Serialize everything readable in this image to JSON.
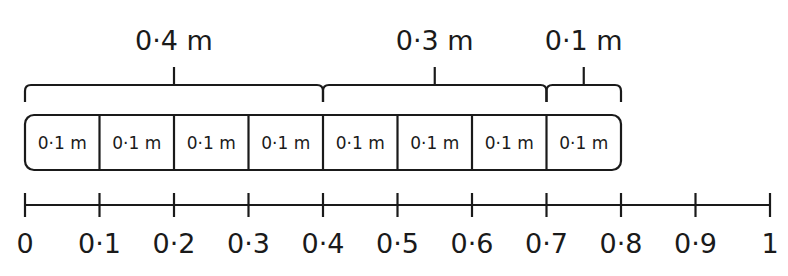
{
  "diagram": {
    "type": "bar-model-number-line",
    "groups": [
      {
        "label": "0·4 m",
        "start": 0,
        "end": 0.4
      },
      {
        "label": "0·3 m",
        "start": 0.4,
        "end": 0.7
      },
      {
        "label": "0·1 m",
        "start": 0.7,
        "end": 0.8
      }
    ],
    "cells": [
      "0·1 m",
      "0·1 m",
      "0·1 m",
      "0·1 m",
      "0·1 m",
      "0·1 m",
      "0·1 m",
      "0·1 m"
    ],
    "number_line": {
      "min": 0,
      "max": 1,
      "ticks": [
        0,
        0.1,
        0.2,
        0.3,
        0.4,
        0.5,
        0.6,
        0.7,
        0.8,
        0.9,
        1
      ],
      "tick_labels": [
        "0",
        "0·1",
        "0·2",
        "0·3",
        "0·4",
        "0·5",
        "0·6",
        "0·7",
        "0·8",
        "0·9",
        "1"
      ]
    }
  }
}
